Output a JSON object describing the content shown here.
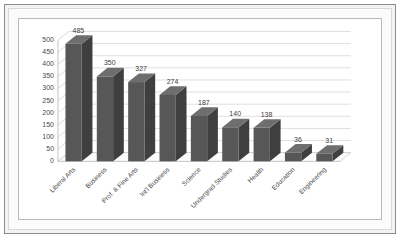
{
  "chart_data": {
    "type": "bar",
    "title": "",
    "subtitle": "",
    "xlabel": "",
    "ylabel": "",
    "categories": [
      "Liberal Arts",
      "Business",
      "Prof. & Fine Arts",
      "Int'l Business",
      "Science",
      "Undergrad Studies",
      "Health",
      "Education",
      "Engineering"
    ],
    "values": [
      485,
      350,
      327,
      274,
      187,
      140,
      138,
      36,
      31
    ],
    "value_labels": [
      "485",
      "350",
      "327",
      "274",
      "187",
      "140",
      "138",
      "36",
      "31"
    ],
    "ylim": [
      0,
      500
    ],
    "ytick_step": 50,
    "ytick_labels": [
      "0",
      "50",
      "100",
      "150",
      "200",
      "250",
      "300",
      "350",
      "400",
      "450",
      "500"
    ],
    "ytick_values": [
      0,
      50,
      100,
      150,
      200,
      250,
      300,
      350,
      400,
      450,
      500
    ],
    "grid": true,
    "grid_axis": "y",
    "legend": false,
    "legend_position": "none",
    "three_d": true,
    "category_label_rotation": -45,
    "colors": {
      "bar_front": "#575757",
      "bar_side": "#3f3f3f",
      "bar_top": "#6e6e6e",
      "gridline": "#cfcfcf",
      "axis": "#b0b0b0",
      "plot_background": "#ffffff",
      "frame_outer": "#8a8a8a",
      "frame_fill": "#f2f2f2",
      "tick_text": "#4a4a4a",
      "value_text": "#3d3d3d"
    }
  }
}
